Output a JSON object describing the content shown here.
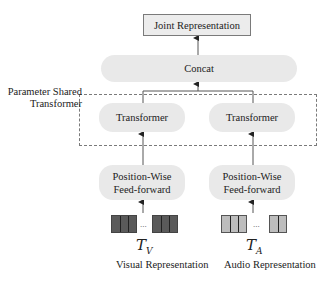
{
  "diagram": {
    "nodes": {
      "joint": "Joint Representation",
      "concat": "Concat",
      "transformer_left": "Transformer",
      "transformer_right": "Transformer",
      "feedforward_left_line1": "Position-Wise",
      "feedforward_left_line2": "Feed-forward",
      "feedforward_right_line1": "Position-Wise",
      "feedforward_right_line2": "Feed-forward"
    },
    "group_label_line1": "Parameter Shared",
    "group_label_line2": "Transformer",
    "inputs": {
      "visual": {
        "symbol": "T",
        "subscript": "V",
        "label": "Visual Representation",
        "ellipsis": "...",
        "color": "#5a5a5a"
      },
      "audio": {
        "symbol": "T",
        "subscript": "A",
        "label": "Audio Representation",
        "ellipsis": "...",
        "color": "#bdbdbd"
      }
    },
    "colors": {
      "node_fill": "#e9e9e9",
      "border": "#7a7a7a",
      "arrow": "#333333"
    }
  }
}
